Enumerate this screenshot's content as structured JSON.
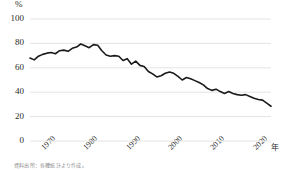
{
  "chart_data": {
    "type": "line",
    "title": "",
    "xlabel": "年",
    "ylabel": "%",
    "ylim": [
      0,
      100
    ],
    "xlim": [
      1965,
      2022
    ],
    "yticks": [
      100,
      80,
      60,
      40,
      20,
      0
    ],
    "xticks": [
      1970,
      1980,
      1990,
      2000,
      2010,
      2020
    ],
    "grid": true,
    "legend": false,
    "line_color": "#1a1a1a",
    "grid_color": "#e4e4e4",
    "x": [
      1965,
      1966,
      1967,
      1968,
      1969,
      1970,
      1971,
      1972,
      1973,
      1974,
      1975,
      1976,
      1977,
      1978,
      1979,
      1980,
      1981,
      1982,
      1983,
      1984,
      1985,
      1986,
      1987,
      1988,
      1989,
      1990,
      1991,
      1992,
      1993,
      1994,
      1995,
      1996,
      1997,
      1998,
      1999,
      2000,
      2001,
      2002,
      2003,
      2004,
      2005,
      2006,
      2007,
      2008,
      2009,
      2010,
      2011,
      2012,
      2013,
      2014,
      2015,
      2016,
      2017,
      2018,
      2019,
      2020,
      2021,
      2022
    ],
    "values": [
      68.0,
      66.5,
      69.5,
      71.0,
      72.0,
      72.5,
      71.5,
      74.0,
      74.5,
      73.5,
      76.0,
      77.0,
      79.5,
      78.0,
      76.5,
      79.0,
      78.5,
      74.0,
      70.5,
      69.5,
      70.0,
      69.5,
      66.0,
      67.5,
      63.0,
      65.5,
      62.0,
      61.0,
      57.0,
      55.0,
      52.5,
      53.5,
      55.5,
      56.5,
      55.5,
      53.0,
      50.0,
      52.0,
      51.0,
      49.5,
      48.0,
      46.0,
      43.0,
      41.5,
      42.5,
      40.5,
      39.0,
      40.5,
      39.0,
      38.0,
      37.5,
      38.0,
      36.5,
      35.0,
      34.0,
      33.5,
      31.0,
      28.5
    ],
    "series_name": "比率"
  },
  "axis": {
    "y_unit": "%",
    "x_unit": "年",
    "y_labels": [
      "100",
      "80",
      "60",
      "40",
      "20",
      "0"
    ],
    "x_labels": [
      "1970",
      "1980",
      "1990",
      "2000",
      "2010",
      "2020"
    ]
  },
  "caption": "資料出所：各種統計より作成。"
}
